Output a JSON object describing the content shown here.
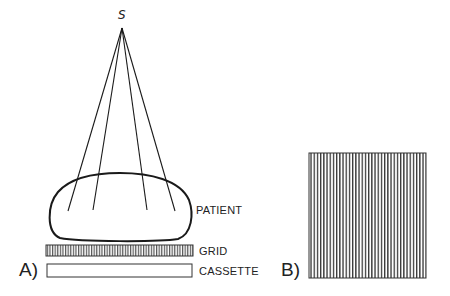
{
  "diagram": {
    "source_label": "S",
    "panel_a": {
      "label": "A)",
      "components": {
        "patient": "PATIENT",
        "grid": "GRID",
        "cassette": "CASSETTE"
      }
    },
    "panel_b": {
      "label": "B)"
    }
  }
}
